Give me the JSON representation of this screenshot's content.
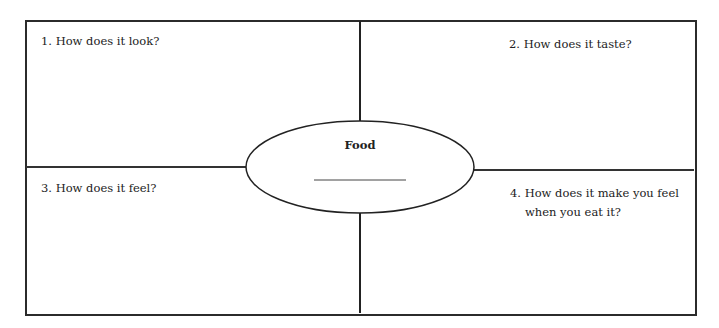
{
  "worksheet": {
    "center": {
      "title": "Food",
      "blank_line": ""
    },
    "quadrants": [
      {
        "number": "1.",
        "question": "How does it look?"
      },
      {
        "number": "2.",
        "question": "How does it taste?"
      },
      {
        "number": "3.",
        "question": "How does it feel?"
      },
      {
        "number": "4.",
        "question_line1": "How does it make you feel",
        "question_line2": "when you eat it?"
      }
    ],
    "colors": {
      "line": "#222222",
      "background": "#ffffff"
    }
  }
}
